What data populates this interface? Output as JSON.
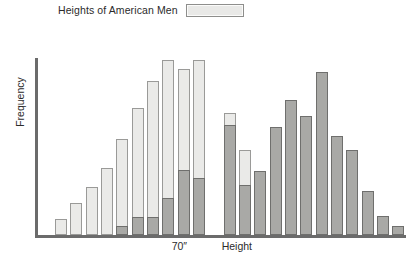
{
  "legend": {
    "label": "Heights of American Men",
    "swatch_color": "#eaeae8",
    "swatch_border": "#8e8e8c",
    "position": "top-left"
  },
  "axes": {
    "ylabel": "Frequency",
    "xlabel": "Height",
    "xtick_label": "70″",
    "axis_color": "#6b6b6b"
  },
  "chart_data": {
    "type": "bar",
    "title": "",
    "subtitle": "",
    "xlabel": "Height",
    "ylabel": "Frequency",
    "grid": false,
    "legend_position": "top-left",
    "xtick_labels": [
      "70″"
    ],
    "xtick_positions": [
      10
    ],
    "ylim": [
      0,
      100
    ],
    "axis_tick_values_shown": false,
    "bins": 22,
    "categories": [
      "b1",
      "b2",
      "b3",
      "b4",
      "b5",
      "b6",
      "b7",
      "b8",
      "b9",
      "b10",
      "b11",
      "b12",
      "b13",
      "b14",
      "b15",
      "b16",
      "b17",
      "b18",
      "b19",
      "b20",
      "b21",
      "b22"
    ],
    "series": [
      {
        "name": "Heights of American Men",
        "color": "#eaeae8",
        "border": "#9a9a98",
        "values": [
          0,
          9,
          18,
          27,
          38,
          54,
          72,
          87,
          99,
          94,
          99,
          0,
          69,
          48,
          0,
          0,
          0,
          0,
          0,
          0,
          0,
          0
        ]
      },
      {
        "name": "Heights of American Women",
        "color": "#a9a9a6",
        "border": "#6f6f6d",
        "values": [
          0,
          0,
          0,
          0,
          0,
          5,
          10,
          10,
          21,
          37,
          32,
          0,
          62,
          28,
          32,
          61,
          14,
          76,
          92,
          0,
          0,
          0
        ]
      }
    ],
    "rendering_note": "Two overlaid histogram series sharing the same bin slots; dark series drawn in front of light series.",
    "bars": [
      {
        "slot": 1,
        "light": 0,
        "dark": 0
      },
      {
        "slot": 2,
        "light": 9,
        "dark": 0
      },
      {
        "slot": 3,
        "light": 18,
        "dark": 0
      },
      {
        "slot": 4,
        "light": 27,
        "dark": 0
      },
      {
        "slot": 5,
        "light": 38,
        "dark": 0
      },
      {
        "slot": 6,
        "light": 54,
        "dark": 5
      },
      {
        "slot": 7,
        "light": 72,
        "dark": 10
      },
      {
        "slot": 8,
        "light": 87,
        "dark": 10
      },
      {
        "slot": 9,
        "light": 99,
        "dark": 21
      },
      {
        "slot": 10,
        "light": 94,
        "dark": 37
      },
      {
        "slot": 11,
        "light": 99,
        "dark": 32
      },
      {
        "slot": 12,
        "light": 0,
        "dark": 0
      },
      {
        "slot": 13,
        "light": 69,
        "dark": 62
      },
      {
        "slot": 14,
        "light": 48,
        "dark": 28
      },
      {
        "slot": 15,
        "light": 32,
        "dark": 36
      },
      {
        "slot": 16,
        "light": 19,
        "dark": 61
      },
      {
        "slot": 17,
        "light": 14,
        "dark": 76
      },
      {
        "slot": 18,
        "light": 0,
        "dark": 67
      },
      {
        "slot": 19,
        "light": 0,
        "dark": 92
      },
      {
        "slot": 20,
        "light": 0,
        "dark": 56
      },
      {
        "slot": 21,
        "light": 0,
        "dark": 48
      },
      {
        "slot": 22,
        "light": 0,
        "dark": 25
      },
      {
        "slot": 23,
        "light": 0,
        "dark": 11
      },
      {
        "slot": 24,
        "light": 0,
        "dark": 5
      }
    ]
  }
}
